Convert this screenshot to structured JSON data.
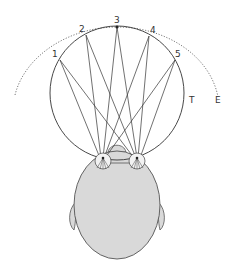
{
  "diagram": {
    "points": [
      {
        "label": "1",
        "x": 60,
        "y": 60,
        "lx": 52,
        "ly": 57
      },
      {
        "label": "2",
        "x": 86,
        "y": 35,
        "lx": 79,
        "ly": 32
      },
      {
        "label": "3",
        "x": 117,
        "y": 27,
        "lx": 114,
        "ly": 23
      },
      {
        "label": "4",
        "x": 149,
        "y": 36,
        "lx": 150,
        "ly": 33
      },
      {
        "label": "5",
        "x": 175,
        "y": 60,
        "lx": 175,
        "ly": 57
      }
    ],
    "labels": {
      "circle": "T",
      "arc": "E"
    },
    "colors": {
      "line": "#333333",
      "head_fill": "#d9d9d9",
      "head_stroke": "#555555"
    }
  }
}
